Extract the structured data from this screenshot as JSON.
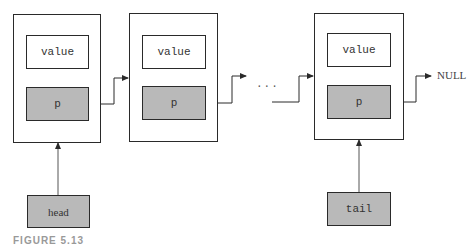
{
  "diagram": {
    "type": "singly-linked-list",
    "nodes": [
      {
        "id": "node-1",
        "value_label": "value",
        "pointer_label": "p"
      },
      {
        "id": "node-2",
        "value_label": "value",
        "pointer_label": "p"
      },
      {
        "id": "node-3",
        "value_label": "value",
        "pointer_label": "p"
      }
    ],
    "ellipsis": "···",
    "terminator": "NULL",
    "head_label": "head",
    "tail_label": "tail",
    "caption": "FIGURE 5.13",
    "colors": {
      "background": "#ffffff",
      "stroke": "#2a2a2a",
      "pointer_fill": "#b9b9b9",
      "field_fill": "#ffffff"
    }
  }
}
